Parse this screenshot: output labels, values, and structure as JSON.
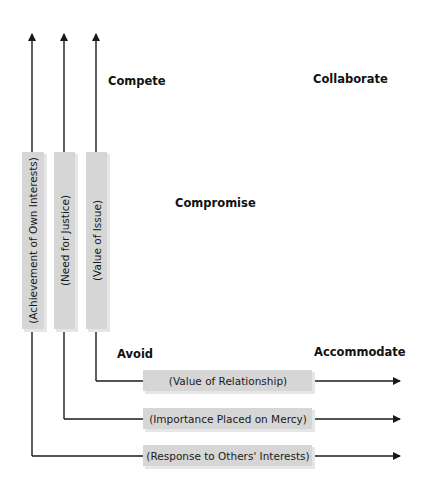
{
  "modes": {
    "compete": "Compete",
    "collaborate": "Collaborate",
    "compromise": "Compromise",
    "avoid": "Avoid",
    "accommodate": "Accommodate"
  },
  "vertical_axes": [
    {
      "label": "(Achievement of Own Interests)"
    },
    {
      "label": "(Need for Justice)"
    },
    {
      "label": "(Value of Issue)"
    }
  ],
  "horizontal_axes": [
    {
      "label": "(Value of Relationship)"
    },
    {
      "label": "(Importance Placed on Mercy)"
    },
    {
      "label": "(Response to Others' Interests)"
    }
  ],
  "colors": {
    "line": "#1a1a1a",
    "box_fill": "#d6d6d6",
    "box_shadow": "#e6e6e6"
  }
}
